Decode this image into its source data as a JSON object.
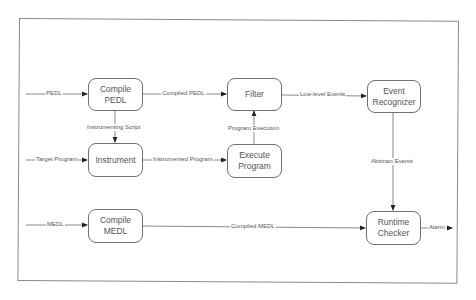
{
  "diagram": {
    "nodes": {
      "compile_pedl": {
        "label": "Compile\nPEDL"
      },
      "filter": {
        "label": "Filter"
      },
      "event_recognizer": {
        "label": "Event\nRecognizer"
      },
      "instrument": {
        "label": "Instrument"
      },
      "execute_program": {
        "label": "Execute\nProgram"
      },
      "compile_medl": {
        "label": "Compile\nMEDL"
      },
      "runtime_checker": {
        "label": "Runtime\nChecker"
      }
    },
    "edges": {
      "pedl_in": {
        "label": "PEDL",
        "from": "",
        "to": "compile_pedl"
      },
      "compiled_pedl": {
        "label": "Compiled PEDL",
        "from": "compile_pedl",
        "to": "filter"
      },
      "low_level_events": {
        "label": "Low-level Events",
        "from": "filter",
        "to": "event_recognizer"
      },
      "instrumenting_script": {
        "label": "Instrumenting Script",
        "from": "compile_pedl",
        "to": "instrument"
      },
      "program_execution": {
        "label": "Program Execution",
        "from": "execute_program",
        "to": "filter"
      },
      "target_program": {
        "label": "Target Program",
        "from": "",
        "to": "instrument"
      },
      "instrumented_program": {
        "label": "Instrumented Program",
        "from": "instrument",
        "to": "execute_program"
      },
      "abstract_events": {
        "label": "Abstract Events",
        "from": "event_recognizer",
        "to": "runtime_checker"
      },
      "medl_in": {
        "label": "MEDL",
        "from": "",
        "to": "compile_medl"
      },
      "compiled_medl": {
        "label": "Compiled MEDL",
        "from": "compile_medl",
        "to": "runtime_checker"
      },
      "alarm": {
        "label": "Alarm",
        "from": "runtime_checker",
        "to": ""
      }
    }
  }
}
